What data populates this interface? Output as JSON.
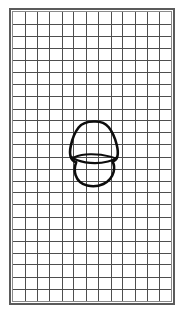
{
  "document": {
    "title": "Graph paper grid with hand-drawn tooth outline",
    "background_color": "#ffffff",
    "width": 189,
    "height": 324
  },
  "grid": {
    "label": "ruled grid sheet",
    "columns": 13,
    "rows": 24,
    "cell_width": 12.4,
    "cell_height": 12.2,
    "line_color": "#4a4a4a",
    "line_width": 1,
    "frame_color": "#5b5b5b",
    "frame_width": 2,
    "inner_frame_color": "#8a8a8a",
    "background_color": "#ffffff",
    "frame": {
      "x": 9,
      "y": 8,
      "width": 166,
      "height": 297
    }
  },
  "figure": {
    "label": "tooth outline",
    "stroke_color": "#0d0d0d",
    "stroke_width": 2.6,
    "fill": "none",
    "bounds": {
      "x": 70,
      "y": 121,
      "width": 48,
      "height": 65
    },
    "center": {
      "x": 94,
      "y": 153
    }
  },
  "chart_data": {
    "type": "scatter",
    "xlabel": "",
    "ylabel": "",
    "grid": true,
    "legend": false,
    "xlim": [
      0,
      13
    ],
    "ylim": [
      0,
      24
    ],
    "gridlines": {
      "x_count": 13,
      "y_count": 24
    },
    "annotations": [
      {
        "label": "tooth outline",
        "type": "closed-curve",
        "x_range": [
          4.9,
          8.8
        ],
        "y_range": [
          9.7,
          15.0
        ]
      },
      {
        "label": "cervical line",
        "type": "open-curve",
        "x_range": [
          5.0,
          8.7
        ],
        "y_range": [
          11.5,
          12.2
        ]
      }
    ],
    "series": []
  }
}
